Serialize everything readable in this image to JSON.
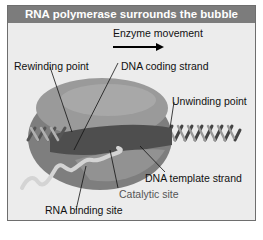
{
  "header": {
    "title": "RNA polymerase surrounds the bubble"
  },
  "labels": {
    "enzyme_movement": "Enzyme movement",
    "rewinding_point": "Rewinding point",
    "dna_coding_strand": "DNA coding strand",
    "unwinding_point": "Unwinding point",
    "dna_template_strand": "DNA template strand",
    "catalytic_site": "Catalytic site",
    "rna_binding_site": "RNA binding site"
  },
  "colors": {
    "header_bg": "#7c7c7c",
    "panel_bg": "#ececec",
    "enzyme": "#8a8a8a",
    "enzyme_dark": "#4a4a4a",
    "rna": "#d8d8d8",
    "dna": "#5a5a5a"
  }
}
